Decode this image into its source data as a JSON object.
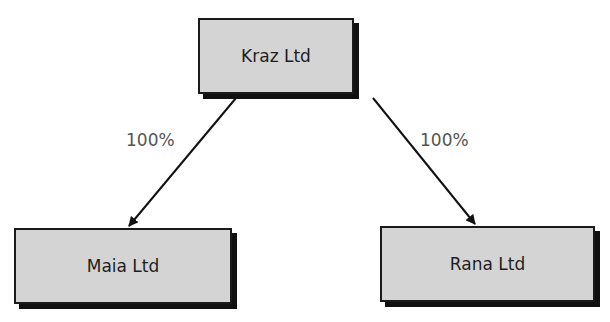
{
  "diagram": {
    "type": "ownership-structure",
    "nodes": [
      {
        "id": "kraz",
        "label": "Kraz Ltd",
        "role": "parent"
      },
      {
        "id": "maia",
        "label": "Maia Ltd",
        "role": "subsidiary"
      },
      {
        "id": "rana",
        "label": "Rana Ltd",
        "role": "subsidiary"
      }
    ],
    "edges": [
      {
        "from": "kraz",
        "to": "maia",
        "label": "100%"
      },
      {
        "from": "kraz",
        "to": "rana",
        "label": "100%"
      }
    ]
  },
  "colors": {
    "box_fill": "#d4d4d4",
    "box_border": "#1a1a1a",
    "shadow": "#111111",
    "label_text": "#555555"
  }
}
